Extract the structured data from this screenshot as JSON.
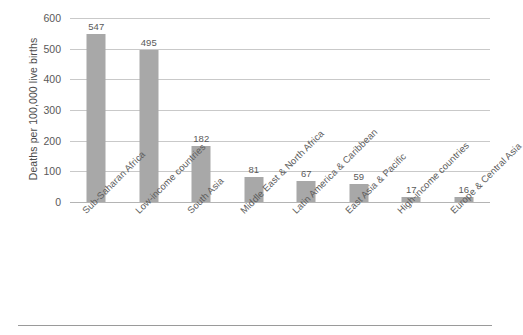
{
  "chart_data": {
    "type": "bar",
    "title": "",
    "xlabel": "",
    "ylabel": "Deaths per 100,000 live births",
    "categories": [
      "Sub-Saharan Africa",
      "Low-income countries",
      "South Asia",
      "Middle East & North Africa",
      "Latin America & Caribbean",
      "East Asia & Pacific",
      "High-income countries",
      "Europe & Central Asia"
    ],
    "values": [
      547,
      495,
      182,
      81,
      67,
      59,
      17,
      16
    ],
    "value_labels": [
      "547",
      "495",
      "182",
      "81",
      "67",
      "59",
      "17",
      "16"
    ],
    "ylim": [
      0,
      600
    ],
    "yticks": [
      0,
      100,
      200,
      300,
      400,
      500,
      600
    ],
    "ytick_labels": [
      "0",
      "100",
      "200",
      "300",
      "400",
      "500",
      "600"
    ],
    "grid": true,
    "legend": null,
    "bar_color": "#a8a8a8",
    "gridline_color": "#c9c9c9",
    "background_color": "#ffffff",
    "label_rotation": -45
  }
}
